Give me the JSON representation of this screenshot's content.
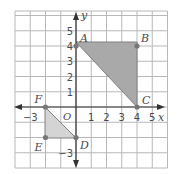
{
  "diagram": {
    "type": "coordinate-plane",
    "origin_label": "O",
    "x_axis_label": "x",
    "y_axis_label": "y",
    "x_tick_labels": [
      {
        "value": -3,
        "text": "−3"
      },
      {
        "value": 1,
        "text": "1"
      },
      {
        "value": 2,
        "text": "2"
      },
      {
        "value": 3,
        "text": "3"
      },
      {
        "value": 4,
        "text": "4"
      },
      {
        "value": 5,
        "text": "5"
      }
    ],
    "y_tick_labels": [
      {
        "value": 1,
        "text": "1"
      },
      {
        "value": 2,
        "text": "2"
      },
      {
        "value": 3,
        "text": "3"
      },
      {
        "value": 4,
        "text": "4"
      },
      {
        "value": 5,
        "text": "5"
      },
      {
        "value": -3,
        "text": "−3"
      }
    ],
    "grid": {
      "x_min": -4,
      "x_max": 6,
      "y_min": -4,
      "y_max": 6.3
    },
    "points": [
      {
        "label": "A",
        "x": 0,
        "y": 4
      },
      {
        "label": "B",
        "x": 4,
        "y": 4
      },
      {
        "label": "C",
        "x": 4,
        "y": 0
      },
      {
        "label": "D",
        "x": 0,
        "y": -2
      },
      {
        "label": "E",
        "x": -2,
        "y": -2
      },
      {
        "label": "F",
        "x": -2,
        "y": 0
      }
    ],
    "shapes": [
      {
        "name": "triangle-ABC",
        "vertices": [
          "A",
          "B",
          "C"
        ],
        "fill": "#a9a9a9"
      },
      {
        "name": "triangle-DEF",
        "vertices": [
          "D",
          "E",
          "F"
        ],
        "fill": "#d4d4d4"
      }
    ],
    "colors": {
      "grid": "#b8b8b8",
      "axis": "#333333",
      "point": "#777777",
      "label": "#4a4a4a"
    }
  }
}
